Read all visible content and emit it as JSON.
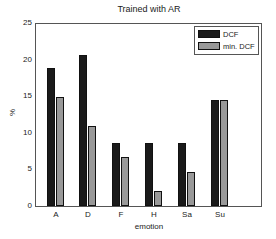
{
  "chart_data": {
    "type": "bar",
    "title": "Trained with AR",
    "xlabel": "emotion",
    "ylabel": "%",
    "ylim": [
      0,
      25
    ],
    "yticks": [
      0,
      5,
      10,
      15,
      20,
      25
    ],
    "grid": false,
    "legend_position": "upper right",
    "categories": [
      "A",
      "D",
      "F",
      "H",
      "Sa",
      "Su"
    ],
    "series": [
      {
        "name": "DCF",
        "color": "#1a1a1a",
        "values": [
          19.0,
          20.8,
          8.7,
          8.6,
          8.6,
          14.5
        ]
      },
      {
        "name": "min. DCF",
        "color": "#999999",
        "values": [
          15.0,
          11.0,
          6.7,
          2.0,
          4.7,
          14.5
        ]
      }
    ]
  }
}
